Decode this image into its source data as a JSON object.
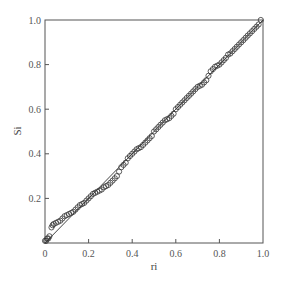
{
  "chart_data": {
    "type": "scatter",
    "title": "",
    "xlabel": "ri",
    "ylabel": "Si",
    "xlim": [
      0,
      1.0
    ],
    "ylim": [
      0,
      1.0
    ],
    "grid": false,
    "legend": null,
    "x_ticks": [
      0,
      0.2,
      0.4,
      0.6,
      0.8,
      1.0
    ],
    "x_tick_labels": [
      "0",
      "0.2",
      "0.4",
      "0.6",
      "0.8",
      "1.0"
    ],
    "y_ticks": [
      0.2,
      0.4,
      0.6,
      0.8,
      1.0
    ],
    "y_tick_labels": [
      "0.2",
      "0.4",
      "0.6",
      "0.8",
      "1.0"
    ],
    "reference_line": {
      "x": [
        0,
        1.0
      ],
      "y": [
        0,
        1.0
      ],
      "style": "solid"
    },
    "series": [
      {
        "name": "observed",
        "marker": "open-circle",
        "x": [
          0.0,
          0.005,
          0.01,
          0.015,
          0.02,
          0.03,
          0.035,
          0.04,
          0.05,
          0.06,
          0.07,
          0.08,
          0.09,
          0.1,
          0.11,
          0.12,
          0.13,
          0.14,
          0.15,
          0.16,
          0.17,
          0.18,
          0.19,
          0.2,
          0.21,
          0.22,
          0.23,
          0.24,
          0.25,
          0.26,
          0.27,
          0.28,
          0.29,
          0.3,
          0.31,
          0.32,
          0.33,
          0.34,
          0.35,
          0.36,
          0.37,
          0.38,
          0.39,
          0.4,
          0.41,
          0.42,
          0.43,
          0.44,
          0.45,
          0.46,
          0.47,
          0.48,
          0.49,
          0.5,
          0.51,
          0.52,
          0.53,
          0.54,
          0.55,
          0.56,
          0.57,
          0.58,
          0.59,
          0.6,
          0.61,
          0.62,
          0.63,
          0.64,
          0.65,
          0.66,
          0.67,
          0.68,
          0.69,
          0.7,
          0.71,
          0.72,
          0.73,
          0.74,
          0.75,
          0.76,
          0.77,
          0.78,
          0.79,
          0.8,
          0.81,
          0.82,
          0.83,
          0.84,
          0.85,
          0.86,
          0.87,
          0.88,
          0.89,
          0.9,
          0.91,
          0.92,
          0.93,
          0.94,
          0.95,
          0.96,
          0.97,
          0.98,
          0.99
        ],
        "y": [
          0.01,
          0.01,
          0.02,
          0.02,
          0.03,
          0.07,
          0.08,
          0.085,
          0.09,
          0.095,
          0.1,
          0.11,
          0.12,
          0.125,
          0.13,
          0.135,
          0.14,
          0.15,
          0.16,
          0.17,
          0.175,
          0.18,
          0.19,
          0.2,
          0.21,
          0.22,
          0.225,
          0.23,
          0.235,
          0.24,
          0.25,
          0.255,
          0.26,
          0.27,
          0.28,
          0.29,
          0.3,
          0.32,
          0.34,
          0.35,
          0.36,
          0.38,
          0.39,
          0.4,
          0.41,
          0.42,
          0.425,
          0.43,
          0.44,
          0.45,
          0.46,
          0.47,
          0.48,
          0.5,
          0.51,
          0.52,
          0.53,
          0.54,
          0.55,
          0.555,
          0.56,
          0.57,
          0.58,
          0.6,
          0.61,
          0.62,
          0.63,
          0.64,
          0.65,
          0.66,
          0.67,
          0.68,
          0.69,
          0.7,
          0.705,
          0.71,
          0.72,
          0.73,
          0.75,
          0.77,
          0.78,
          0.79,
          0.795,
          0.8,
          0.81,
          0.82,
          0.83,
          0.845,
          0.85,
          0.86,
          0.87,
          0.88,
          0.89,
          0.9,
          0.91,
          0.92,
          0.93,
          0.94,
          0.95,
          0.96,
          0.97,
          0.98,
          1.0
        ]
      }
    ]
  },
  "plot_area": {
    "left": 45,
    "top": 20,
    "right": 263,
    "bottom": 243
  },
  "colors": {
    "axis": "#555555",
    "marker_stroke": "#333333",
    "reference_line": "#444444"
  }
}
